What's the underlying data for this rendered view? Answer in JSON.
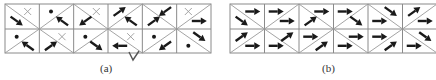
{
  "figure": {
    "panels": [
      {
        "id": "a",
        "caption": "(a)",
        "caption_x": 106,
        "x0": 5,
        "x1": 211,
        "y0": 4,
        "ym": 29,
        "y1": 53,
        "columns": 6,
        "cells": [
          {
            "row": 0,
            "col": 0,
            "tri_a": "cross",
            "tri_b": "se"
          },
          {
            "row": 0,
            "col": 1,
            "tri_a": "dot",
            "tri_b": "nw"
          },
          {
            "row": 0,
            "col": 2,
            "tri_a": "cross",
            "tri_b": "sw"
          },
          {
            "row": 0,
            "col": 3,
            "tri_a": "ne",
            "tri_b": "nw"
          },
          {
            "row": 0,
            "col": 4,
            "tri_a": "sw",
            "tri_b": "ne"
          },
          {
            "row": 0,
            "col": 5,
            "tri_a": "cross",
            "tri_b": "e"
          },
          {
            "row": 1,
            "col": 0,
            "tri_a": "dot",
            "tri_b": "nw"
          },
          {
            "row": 1,
            "col": 1,
            "tri_a": "cross",
            "tri_b": "ne"
          },
          {
            "row": 1,
            "col": 2,
            "tri_a": "dot",
            "tri_b": "se"
          },
          {
            "row": 1,
            "col": 3,
            "tri_a": "cross",
            "tri_b": "w"
          },
          {
            "row": 1,
            "col": 4,
            "tri_a": "dot",
            "tri_b": "sw"
          },
          {
            "row": 1,
            "col": 5,
            "tri_a": "se",
            "tri_b": "dot"
          }
        ]
      },
      {
        "id": "b",
        "caption": "(b)",
        "caption_x": 328,
        "x0": 230,
        "x1": 437,
        "y0": 4,
        "ym": 29,
        "y1": 53,
        "columns": 6,
        "cells": [
          {
            "row": 0,
            "col": 0,
            "tri_a": "e",
            "tri_b": "se"
          },
          {
            "row": 0,
            "col": 1,
            "tri_a": "e",
            "tri_b": "e"
          },
          {
            "row": 0,
            "col": 2,
            "tri_a": "e",
            "tri_b": "ne"
          },
          {
            "row": 0,
            "col": 3,
            "tri_a": "e",
            "tri_b": "se"
          },
          {
            "row": 0,
            "col": 4,
            "tri_a": "se",
            "tri_b": "e"
          },
          {
            "row": 0,
            "col": 5,
            "tri_a": "ne",
            "tri_b": "e"
          },
          {
            "row": 1,
            "col": 0,
            "tri_a": "ne",
            "tri_b": "e"
          },
          {
            "row": 1,
            "col": 1,
            "tri_a": "ne",
            "tri_b": "e"
          },
          {
            "row": 1,
            "col": 2,
            "tri_a": "e",
            "tri_b": "ne"
          },
          {
            "row": 1,
            "col": 3,
            "tri_a": "e",
            "tri_b": "e"
          },
          {
            "row": 1,
            "col": 4,
            "tri_a": "e",
            "tri_b": "ne"
          },
          {
            "row": 1,
            "col": 5,
            "tri_a": "se",
            "tri_b": "e"
          }
        ]
      }
    ],
    "legend": {
      "cross": "cross-marker",
      "dot": "dot-marker",
      "e": "arrow-east",
      "w": "arrow-west",
      "ne": "arrow-northeast",
      "nw": "arrow-northwest",
      "se": "arrow-southeast",
      "sw": "arrow-southwest"
    },
    "colors": {
      "grid": "#8a8a8a",
      "arrow": "#1a1a1a",
      "cross": "#9a9a9a"
    }
  }
}
